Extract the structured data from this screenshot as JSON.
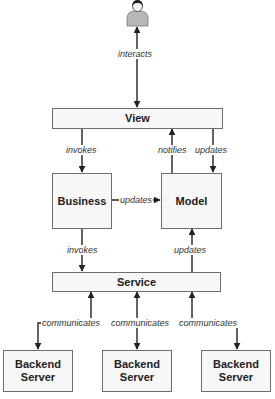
{
  "diagram": {
    "actor": {
      "icon": "user-icon"
    },
    "nodes": {
      "view": "View",
      "business": "Business",
      "model": "Model",
      "service": "Service",
      "backend1": "Backend\nServer",
      "backend2": "Backend\nServer",
      "backend3": "Backend\nServer"
    },
    "edges": {
      "user_view": "interacts",
      "view_business": "invokes",
      "model_view": "notifies",
      "view_model": "updates",
      "business_model": "updates",
      "business_service": "invokes",
      "service_model": "updates",
      "backend1_service": "communicates",
      "backend2_service": "communicates",
      "backend3_service": "communicates"
    },
    "colors": {
      "line": "#222222",
      "box_border": "#6e6e6e",
      "box_fill": "#f7f7f7"
    }
  }
}
